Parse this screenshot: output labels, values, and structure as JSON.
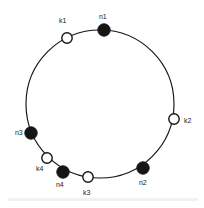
{
  "figure": {
    "width": 204,
    "height": 208,
    "background_color": "#ffffff",
    "band_color": "#f1f1f1"
  },
  "ring": {
    "center_x": 100,
    "center_y": 104,
    "radius": 74,
    "stroke_color": "#141414",
    "stroke_width": 1.15
  },
  "legend": {
    "filled_meaning": "node",
    "open_meaning": "key"
  },
  "nodes": [
    {
      "id": "n1",
      "label": "n1",
      "type": "filled",
      "fill": "#151515",
      "cx": 104,
      "cy": 30,
      "r": 6.2,
      "label_x": 99,
      "label_y": 13
    },
    {
      "id": "k1",
      "label": "k1",
      "type": "open",
      "fill": "#ffffff",
      "cx": 67,
      "cy": 38,
      "r": 5.2,
      "label_x": 59,
      "label_y": 17
    },
    {
      "id": "n3",
      "label": "n3",
      "type": "filled",
      "fill": "#151515",
      "cx": 31,
      "cy": 133,
      "r": 6.2,
      "label_x": 15,
      "label_y": 129
    },
    {
      "id": "k4",
      "label": "k4",
      "type": "open",
      "fill": "#ffffff",
      "cx": 47,
      "cy": 158,
      "r": 5.2,
      "label_x": 36,
      "label_y": 165
    },
    {
      "id": "n4",
      "label": "n4",
      "type": "filled",
      "fill": "#151515",
      "cx": 63,
      "cy": 172,
      "r": 6.2,
      "label_x": 56,
      "label_y": 181
    },
    {
      "id": "k3",
      "label": "k3",
      "type": "open",
      "fill": "#ffffff",
      "cx": 88,
      "cy": 177,
      "r": 5.2,
      "label_x": 83,
      "label_y": 189
    },
    {
      "id": "n2",
      "label": "n2",
      "type": "filled",
      "fill": "#151515",
      "cx": 143,
      "cy": 168,
      "r": 6.2,
      "label_x": 139,
      "label_y": 179
    },
    {
      "id": "k2",
      "label": "k2",
      "type": "open",
      "fill": "#ffffff",
      "cx": 174,
      "cy": 119,
      "r": 5.2,
      "label_x": 184,
      "label_y": 117
    }
  ]
}
